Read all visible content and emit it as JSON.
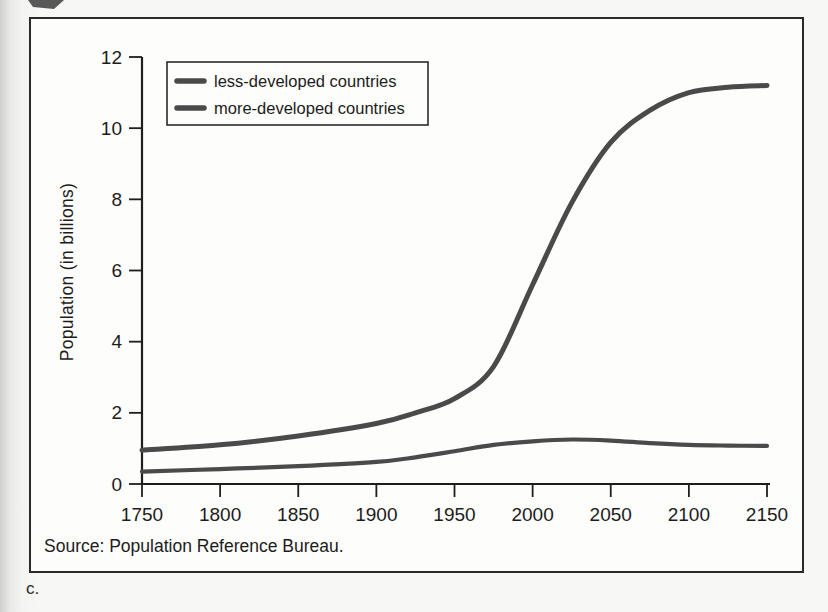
{
  "figure": {
    "caption": "c.",
    "source": "Source: Population Reference Bureau."
  },
  "chart_data": {
    "type": "line",
    "title": "",
    "xlabel": "",
    "ylabel": "Population (in billions)",
    "xlim": [
      1750,
      2150
    ],
    "ylim": [
      0,
      12
    ],
    "x_ticks": [
      1750,
      1800,
      1850,
      1900,
      1950,
      2000,
      2050,
      2100,
      2150
    ],
    "y_ticks": [
      0,
      2,
      4,
      6,
      8,
      10,
      12
    ],
    "grid": false,
    "legend_position": "top-left",
    "x": [
      1750,
      1800,
      1850,
      1900,
      1925,
      1950,
      1975,
      2000,
      2025,
      2050,
      2075,
      2100,
      2125,
      2150
    ],
    "series": [
      {
        "name": "less-developed countries",
        "values": [
          0.95,
          1.1,
          1.35,
          1.7,
          2.0,
          2.4,
          3.3,
          5.6,
          7.9,
          9.6,
          10.5,
          11.0,
          11.15,
          11.2
        ],
        "stroke_width": 5
      },
      {
        "name": "more-developed countries",
        "values": [
          0.35,
          0.42,
          0.5,
          0.62,
          0.75,
          0.92,
          1.1,
          1.2,
          1.25,
          1.22,
          1.15,
          1.1,
          1.08,
          1.07
        ],
        "stroke_width": 4.2
      }
    ],
    "colors": {
      "line": "#4a4a4a",
      "axis": "#1e1e1e",
      "text": "#1c1c1c",
      "frame": "#2a2a2a",
      "paper": "#fdfdfb"
    }
  }
}
